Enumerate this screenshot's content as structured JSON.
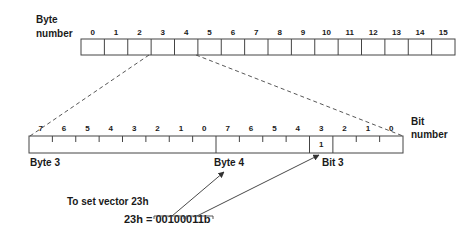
{
  "labels": {
    "byte_number_line1": "Byte",
    "byte_number_line2": "number",
    "bit_number_line1": "Bit",
    "bit_number_line2": "number",
    "byte3": "Byte 3",
    "byte4": "Byte 4",
    "bit3": "Bit 3",
    "instruction": "To set vector 23h",
    "equation": "23h = 00100011b",
    "set_bit_value": "1"
  },
  "byte_row": {
    "numbers": [
      "0",
      "1",
      "2",
      "3",
      "4",
      "5",
      "6",
      "7",
      "8",
      "9",
      "10",
      "11",
      "12",
      "13",
      "14",
      "15"
    ]
  },
  "bit_row": {
    "numbers": [
      "7",
      "6",
      "5",
      "4",
      "3",
      "2",
      "1",
      "0",
      "7",
      "6",
      "5",
      "4",
      "3",
      "2",
      "1",
      "0"
    ]
  },
  "colors": {
    "line": "#333333",
    "text": "#1a1a1a",
    "background": "#ffffff"
  }
}
